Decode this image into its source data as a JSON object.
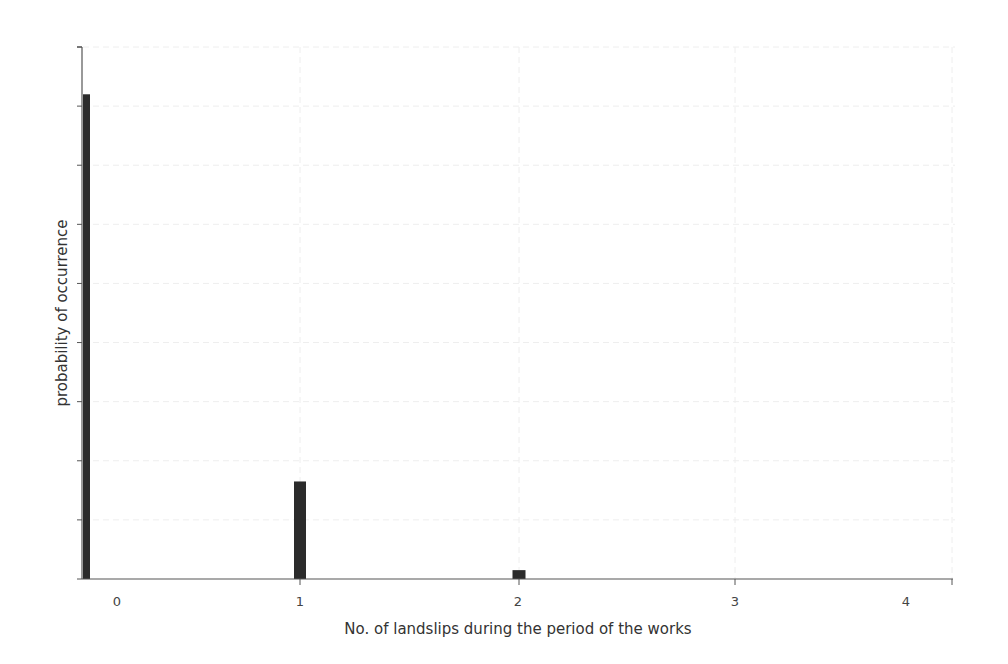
{
  "chart_data": {
    "type": "bar",
    "title": "",
    "xlabel": "No. of landslips during the period of the works",
    "ylabel": "probability of occurrence",
    "categories": [
      "0",
      "1",
      "2",
      "3",
      "4"
    ],
    "values": [
      0.82,
      0.165,
      0.015,
      0,
      0
    ],
    "ylim": [
      0,
      0.9
    ],
    "y_tick_count": 10,
    "y_tick_labels_shown": false,
    "grid": true,
    "legend": null,
    "bar_color": "#2b2b2b",
    "axis_color": "#555555",
    "grid_color": "#eeeeee"
  },
  "axes": {
    "x_title": "No. of landslips during the period of the works",
    "y_title": "probability of occurrence",
    "x_tick_labels": [
      "0",
      "1",
      "2",
      "3",
      "4"
    ]
  }
}
